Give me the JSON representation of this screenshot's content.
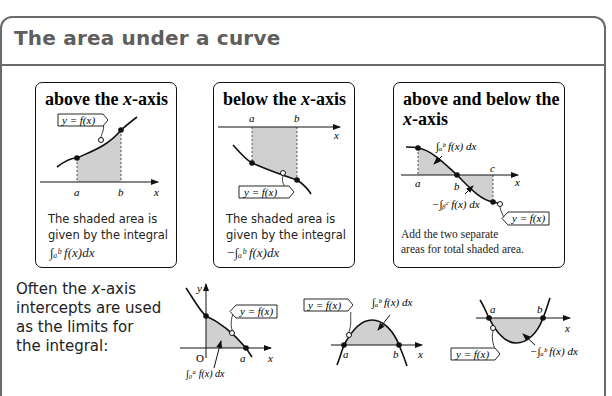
{
  "page": {
    "title": "The area under a curve",
    "accent_gray": "#6b6b6b",
    "shade_color": "#d0d0d0"
  },
  "cards": [
    {
      "title_pre": "above the ",
      "title_var": "x",
      "title_post": "-axis",
      "label_fn": "y = f(x)",
      "label_a": "a",
      "label_b": "b",
      "label_x": "x",
      "text_line1": "The shaded area is",
      "text_line2": "given by the integral",
      "formula": "∫ₐᵇ f(x)dx"
    },
    {
      "title_pre": "below the ",
      "title_var": "x",
      "title_post": "-axis",
      "label_fn": "y = f(x)",
      "label_a": "a",
      "label_b": "b",
      "label_x": "x",
      "text_line1": "The shaded area is",
      "text_line2": "given by the integral",
      "formula": "−∫ₐᵇ f(x)dx"
    },
    {
      "title_line1": "above and below the",
      "title_var": "x",
      "title_post": "-axis",
      "label_fn": "y = f(x)",
      "label_a": "a",
      "label_b": "b",
      "label_c": "c",
      "label_x": "x",
      "integral_top": "∫ₐᵇ f(x) dx",
      "integral_bottom": "−∫ᵦᶜ f(x) dx",
      "text_line1": "Add the two separate",
      "text_line2": "areas for total shaded area."
    }
  ],
  "note": {
    "line1_pre": "Often the ",
    "line1_var": "x",
    "line1_post": "-axis",
    "line2": "intercepts are used",
    "line3": "as the limits for",
    "line4": "the integral:"
  },
  "examples": [
    {
      "label_fn": "y = f(x)",
      "label_y": "y",
      "label_o": "O",
      "label_a": "a",
      "label_x": "x",
      "integral": "∫₀ᵃ f(x) dx"
    },
    {
      "label_fn": "y = f(x)",
      "label_a": "a",
      "label_b": "b",
      "label_x": "x",
      "integral": "∫ₐᵇ f(x) dx"
    },
    {
      "label_fn": "y = f(x)",
      "label_a": "a",
      "label_b": "b",
      "label_x": "x",
      "integral": "−∫ₐᵇ f(x) dx"
    }
  ]
}
